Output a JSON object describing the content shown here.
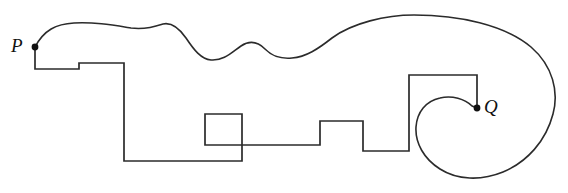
{
  "figure": {
    "type": "line-drawing",
    "title": "",
    "background_color": "#ffffff",
    "stroke_color": "#2b2b2b",
    "canvas": {
      "width": 568,
      "height": 193
    },
    "labels": {
      "start_point": "P",
      "end_point": "Q"
    },
    "points": {
      "P": {
        "x": 35,
        "y": 47,
        "label": "P",
        "marker": "filled-dot",
        "radius": 3.4
      },
      "Q": {
        "x": 477,
        "y": 108,
        "label": "Q",
        "marker": "filled-dot",
        "radius": 3.4
      }
    },
    "paths": {
      "smooth_curve": {
        "name": "wavy-spiral-curve",
        "description": "Smooth wavy curve from P rising over the top, arcing right and spiralling inward to Q",
        "d": "M 35 47 C 44 30 56 24 74 23 C 95 22 112 25 131 28 C 146 30 157 26 163 24 C 172 22 179 28 186 38 C 194 50 201 59 211 60 C 224 61 232 52 241 46 C 250 40 258 42 265 49 C 273 57 281 59 292 58 C 306 57 318 49 332 38 C 352 23 386 15 414 15 C 459 15 505 25 531 47 C 553 66 559 92 553 114 C 546 141 527 162 503 172 C 481 181 457 180 440 169 C 424 159 415 143 416 127 C 417 112 426 101 440 98 C 452 95 465 99 472 106 L 477 108"
      },
      "rectilinear_path": {
        "name": "orthogonal-polyline",
        "description": "Right-angled polyline from P descending and traversing right through two squares up to Q",
        "d": "M 35 47 L 35 69 L 79 69 L 79 63 L 124 63 L 124 161 L 242 161 L 242 114 L 205 114 L 205 145 L 320 145 L 320 121 L 363 121 L 363 151 L 409 151 L 409 75 L 477 75 L 477 108"
      }
    },
    "segments": {
      "squares": [
        {
          "name": "small-square",
          "x": 205,
          "y": 114,
          "width": 37,
          "height": 31
        },
        {
          "name": "large-square",
          "x": 363,
          "y": 120,
          "width": 46,
          "height": 31
        }
      ]
    }
  }
}
